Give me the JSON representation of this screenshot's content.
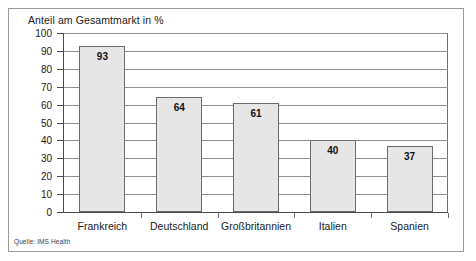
{
  "chart_data": {
    "type": "bar",
    "title": "Anteil am Gesamtmarkt in %",
    "xlabel": "",
    "ylabel": "",
    "categories": [
      "Frankreich",
      "Deutschland",
      "Großbritannien",
      "Italien",
      "Spanien"
    ],
    "values": [
      93,
      64,
      61,
      40,
      37
    ],
    "value_labels": [
      "93",
      "64",
      "61",
      "40",
      "37"
    ],
    "ylim": [
      0,
      100
    ],
    "ytick_labels": [
      "100",
      "90",
      "80",
      "70",
      "60",
      "50",
      "40",
      "30",
      "20",
      "10",
      "0"
    ],
    "ytick_values": [
      100,
      90,
      80,
      70,
      60,
      50,
      40,
      30,
      20,
      10,
      0
    ],
    "grid": true,
    "legend": false,
    "legend_position": "none",
    "series": [
      {
        "name": "Anteil am Gesamtmarkt in %",
        "values": [
          93,
          64,
          61,
          40,
          37
        ]
      }
    ],
    "colors": {
      "bar_fill": "#e6e6e6",
      "bar_border": "#6b6b6b",
      "gridline": "#8d8d8d",
      "axis": "#4a4a4a",
      "frame": "#9a9a9a",
      "text": "#1a1a1a",
      "background": "#ffffff"
    }
  },
  "source": {
    "note": "Quelle: IMS Health"
  }
}
